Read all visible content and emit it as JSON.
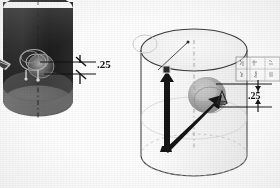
{
  "drawing": {
    "title": "Cylinder feature detail drawing",
    "sheet_color": "#fefefe",
    "ink_color": "#111111"
  },
  "figures": [
    {
      "id": "left-figure",
      "name": "shaded-cylinder-dark",
      "description": "Dark shaded cylinder, isometric view, with circular boss feature on front face",
      "body_color": "#1c1c1c",
      "bottom_face_color": "#6e6e6e",
      "highlight_color": "#9a9a9a",
      "center_axis": "dashed vertical centerline",
      "dimension": {
        "label": ".25",
        "arrow_style": "double-leader with tick arrowheads",
        "leader_count": 2
      }
    },
    {
      "id": "right-figure",
      "name": "outline-cylinder-light",
      "description": "Light outlined cylinder, isometric view, with vector arrows and gray spherical feature",
      "body_color": "#f6f6f6",
      "outline_color": "#3a3a3a",
      "blob_color": "#9b9b9b",
      "vectors": [
        {
          "name": "vertical-vector-arrow",
          "label": ""
        },
        {
          "name": "diagonal-vector-arrow",
          "label": ""
        }
      ],
      "markers": [
        {
          "name": "square-node-marker",
          "label": ""
        },
        {
          "name": "cone-node-marker",
          "label": ""
        }
      ],
      "leader_line": {
        "name": "thin-pointer-line",
        "label": ""
      },
      "dimension": {
        "label": ".25",
        "arrow_style": "double-leader with tick arrowheads",
        "leader_count": 2
      },
      "annotation_box": {
        "name": "symbol-legend-box",
        "rows": 2,
        "columns": 3,
        "cells": [
          "",
          "",
          "",
          "",
          "",
          ""
        ],
        "note": "faint illegible symbol grid"
      }
    }
  ],
  "labels": {
    "left_dimension": ".25",
    "right_dimension": ".25"
  }
}
